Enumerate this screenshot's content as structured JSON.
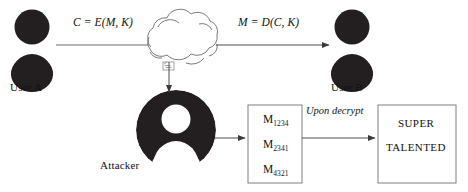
{
  "diagram": {
    "actors": {
      "user_a": {
        "label": "User A",
        "icon": "person-avatar-icon"
      },
      "user_b": {
        "label": "User B",
        "icon": "person-avatar-icon"
      },
      "attacker": {
        "label": "Attacker",
        "icon": "inverted-person-avatar-icon"
      },
      "network": {
        "icon": "cloud-icon",
        "label": ""
      }
    },
    "edges": {
      "encrypt_label": "C = E(M, K)",
      "decrypt_label": "M = D(C, K)",
      "upon_decrypt_label": "Upon decrypt"
    },
    "captured_messages": {
      "items": [
        {
          "base": "M",
          "subscript": "1234"
        },
        {
          "base": "M",
          "subscript": "2341"
        },
        {
          "base": "M",
          "subscript": "4321"
        }
      ]
    },
    "decrypted_output": {
      "line1": "SUPER",
      "line2": "TALENTED"
    },
    "colors": {
      "figure_fill": "#231f20",
      "stroke": "#58595b",
      "text": "#111111",
      "background": "#ffffff"
    }
  }
}
